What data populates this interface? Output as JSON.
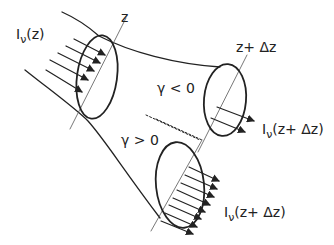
{
  "diagram": {
    "type": "beam-tube-schematic",
    "colors": {
      "stroke": "#222222",
      "background": "#ffffff"
    },
    "labels": {
      "intensity_in": {
        "base": "I",
        "sub": "ν",
        "arg": "(z)"
      },
      "axis_z": "z",
      "axis_z_dz": "z+ Δz",
      "gamma_neg": "γ < 0",
      "gamma_pos": "γ > 0",
      "intensity_out_upper": {
        "base": "I",
        "sub": "ν",
        "arg": "(z+ Δz)"
      },
      "intensity_out_lower": {
        "base": "I",
        "sub": "ν",
        "arg": "(z+ Δz)"
      }
    },
    "nodes": [
      {
        "id": "cross-section-z",
        "arrows": 5
      },
      {
        "id": "cross-section-z-dz-diverging",
        "condition": "γ < 0",
        "arrows": 2
      },
      {
        "id": "cross-section-z-dz-converging",
        "condition": "γ > 0",
        "arrows": 8
      }
    ]
  }
}
